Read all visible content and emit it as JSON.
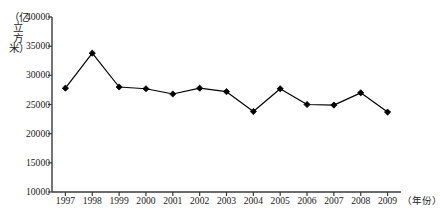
{
  "chart_data": {
    "type": "line",
    "title": "",
    "xlabel": "（年份）",
    "ylabel": "（亿立方米）",
    "categories": [
      "1997",
      "1998",
      "1999",
      "2000",
      "2001",
      "2002",
      "2003",
      "2004",
      "2005",
      "2006",
      "2007",
      "2008",
      "2009"
    ],
    "x": [
      1997,
      1998,
      1999,
      2000,
      2001,
      2002,
      2003,
      2004,
      2005,
      2006,
      2007,
      2008,
      2009
    ],
    "values": [
      27800,
      33800,
      28000,
      27700,
      26800,
      27800,
      27200,
      23800,
      27700,
      25000,
      24900,
      27000,
      23700
    ],
    "series": [
      {
        "name": "",
        "values": [
          27800,
          33800,
          28000,
          27700,
          26800,
          27800,
          27200,
          23800,
          27700,
          25000,
          24900,
          27000,
          23700
        ]
      }
    ],
    "ylim": [
      10000,
      40000
    ],
    "yticks": [
      10000,
      15000,
      20000,
      25000,
      30000,
      35000,
      40000
    ],
    "ytick_labels": [
      "10000",
      "15000",
      "20000",
      "25000",
      "30000",
      "35000",
      "40000"
    ],
    "grid": false,
    "legend": false,
    "legend_position": "none",
    "marker": "diamond",
    "line_color": "#000000",
    "marker_color": "#000000",
    "axis_color": "#3a3a3a",
    "background_color": "#ffffff"
  },
  "axes": {
    "y_caption_chars": "（亿立方米）",
    "x_caption": "（年份）"
  }
}
